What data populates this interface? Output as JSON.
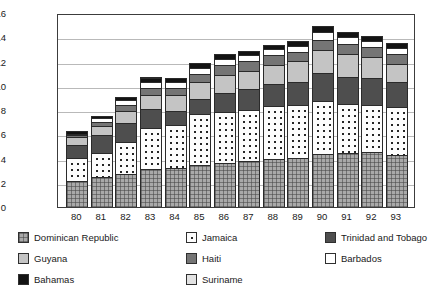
{
  "chart_data": {
    "type": "bar",
    "title": "",
    "subtitle": "",
    "xlabel": "",
    "ylabel": "",
    "stacked": true,
    "grid": true,
    "legend_position": "bottom",
    "ylim": [
      0,
      16
    ],
    "yticks": [
      0,
      2,
      4,
      6,
      8,
      10,
      12,
      14,
      16
    ],
    "ytick_labels": [
      "0",
      "2",
      "4",
      "6",
      "8",
      "10",
      "12",
      "14",
      "16"
    ],
    "categories": [
      "80",
      "81",
      "82",
      "83",
      "84",
      "85",
      "86",
      "87",
      "88",
      "89",
      "90",
      "91",
      "92",
      "93"
    ],
    "series": [
      {
        "name": "Dominican Republic",
        "color": "#a9a9a9",
        "pattern": "crosshatch",
        "values": [
          2.1,
          2.4,
          2.7,
          3.1,
          3.2,
          3.4,
          3.6,
          3.7,
          3.9,
          4.0,
          4.3,
          4.4,
          4.5,
          4.2
        ]
      },
      {
        "name": "Jamaica",
        "color": "#fdfdfd",
        "pattern": "dots",
        "values": [
          1.9,
          2.0,
          2.6,
          3.4,
          3.5,
          4.2,
          4.2,
          4.3,
          4.4,
          4.4,
          4.4,
          4.1,
          3.9,
          4.0
        ]
      },
      {
        "name": "Trinidad and Tobago",
        "color": "#4e4e4e",
        "pattern": "solid",
        "values": [
          1.1,
          1.5,
          1.6,
          1.6,
          1.2,
          1.3,
          1.6,
          1.7,
          1.8,
          1.9,
          2.3,
          2.2,
          2.2,
          2.1
        ]
      },
      {
        "name": "Guyana",
        "color": "#c4c4c4",
        "pattern": "solid",
        "values": [
          0.7,
          0.8,
          1.0,
          1.1,
          1.3,
          1.4,
          1.5,
          1.5,
          1.6,
          1.7,
          1.9,
          1.9,
          1.8,
          1.5
        ]
      },
      {
        "name": "Haiti",
        "color": "#757575",
        "pattern": "solid",
        "values": [
          0.2,
          0.3,
          0.5,
          0.6,
          0.6,
          0.7,
          0.8,
          0.8,
          0.8,
          0.8,
          0.9,
          0.8,
          0.8,
          0.8
        ]
      },
      {
        "name": "Barbados",
        "color": "#ffffff",
        "pattern": "solid",
        "values": [
          0.05,
          0.3,
          0.4,
          0.5,
          0.5,
          0.5,
          0.5,
          0.5,
          0.5,
          0.5,
          0.6,
          0.6,
          0.5,
          0.5
        ]
      },
      {
        "name": "Bahamas",
        "color": "#131313",
        "pattern": "solid",
        "values": [
          0.25,
          0.2,
          0.3,
          0.3,
          0.3,
          0.4,
          0.4,
          0.4,
          0.4,
          0.4,
          0.5,
          0.4,
          0.4,
          0.4
        ]
      },
      {
        "name": "Suriname",
        "color": "#e2e2e2",
        "pattern": "solid",
        "values": [
          0.0,
          0.0,
          0.0,
          0.15,
          0.0,
          0.0,
          0.0,
          0.0,
          0.0,
          0.0,
          0.0,
          0.0,
          0.0,
          0.0
        ]
      }
    ],
    "totals": [
      6.3,
      7.5,
      9.1,
      10.75,
      10.6,
      11.9,
      12.6,
      12.9,
      13.4,
      13.7,
      14.9,
      14.4,
      14.1,
      13.5
    ]
  },
  "legend": {
    "entries": [
      {
        "label": "Dominican Republic",
        "swatch": "swatch-dominican-republic"
      },
      {
        "label": "Jamaica",
        "swatch": "swatch-jamaica"
      },
      {
        "label": "Trinidad and Tobago",
        "swatch": "swatch-trinidad-and-tobago"
      },
      {
        "label": "Guyana",
        "swatch": "swatch-guyana"
      },
      {
        "label": "Haiti",
        "swatch": "swatch-haiti"
      },
      {
        "label": "Barbados",
        "swatch": "swatch-barbados"
      },
      {
        "label": "Bahamas",
        "swatch": "swatch-bahamas"
      },
      {
        "label": "Suriname",
        "swatch": "swatch-suriname"
      }
    ]
  }
}
